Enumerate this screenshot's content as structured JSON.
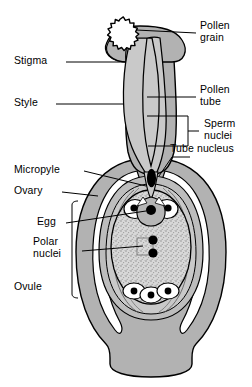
{
  "figure": {
    "type": "biological-diagram",
    "background": "#ffffff",
    "colors": {
      "tissue_gray": "#b2b2b2",
      "tissue_gray_light": "#c4c4c4",
      "embryo_sac_stipple": "#cfcfcf",
      "outline": "#000000",
      "white": "#ffffff",
      "nucleus": "#000000"
    }
  },
  "labels": {
    "left": [
      {
        "id": "stigma",
        "text": "Stigma",
        "x": 14,
        "y": 58,
        "leader_from_x": 66,
        "leader_from_y": 63,
        "leader_to_x": 118,
        "leader_to_y": 63
      },
      {
        "id": "style",
        "text": "Style",
        "x": 14,
        "y": 100,
        "leader_from_x": 56,
        "leader_from_y": 105,
        "leader_to_x": 120,
        "leader_to_y": 105
      },
      {
        "id": "micropyle",
        "text": "Micropyle",
        "x": 14,
        "y": 167,
        "leader_from_x": 80,
        "leader_from_y": 172,
        "leader_to_x": 143,
        "leader_to_y": 180
      },
      {
        "id": "ovary",
        "text": "Ovary",
        "x": 14,
        "y": 188,
        "leader_from_x": 58,
        "leader_from_y": 193,
        "leader_to_x": 99,
        "leader_to_y": 196
      },
      {
        "id": "egg",
        "text": "Egg",
        "x": 36,
        "y": 219,
        "leader_from_x": 64,
        "leader_from_y": 224,
        "leader_to_x": 141,
        "leader_to_y": 209
      },
      {
        "id": "polar-nuclei",
        "text": "Polar\nnuclei",
        "x": 36,
        "y": 240,
        "leader_from_x": 78,
        "leader_from_y": 252,
        "leader_to_x": 143,
        "leader_to_y": 247
      },
      {
        "id": "ovule",
        "text": "Ovule",
        "x": 14,
        "y": 284,
        "leader_from_x": 0,
        "leader_from_y": 0,
        "leader_to_x": 0,
        "leader_to_y": 0
      }
    ],
    "right": [
      {
        "id": "pollen-grain",
        "text": "Pollen\ngrain",
        "x": 198,
        "y": 22,
        "leader_from_x": 196,
        "leader_from_y": 33,
        "leader_to_x": 142,
        "leader_to_y": 33
      },
      {
        "id": "pollen-tube",
        "text": "Pollen\ntube",
        "x": 198,
        "y": 86,
        "leader_from_x": 196,
        "leader_from_y": 97,
        "leader_to_x": 145,
        "leader_to_y": 97
      },
      {
        "id": "sperm-nuclei",
        "text": "Sperm\nnuclei",
        "x": 203,
        "y": 120,
        "leader_from_x": 201,
        "leader_from_y": 131,
        "leader_to_x": 190,
        "leader_to_y": 131
      },
      {
        "id": "tube-nucleus",
        "text": "Tube nucleus",
        "x": 172,
        "y": 145,
        "leader_from_x": 186,
        "leader_from_y": 157,
        "leader_to_x": 157,
        "leader_to_y": 176
      }
    ]
  },
  "structures": [
    {
      "name": "pollen-grain",
      "shape": "spiky-circle",
      "cx": 120,
      "cy": 33,
      "r": 14
    },
    {
      "name": "stigma",
      "shape": "lobed-cap",
      "cx": 142,
      "cy": 55
    },
    {
      "name": "style",
      "shape": "column",
      "top_y": 62,
      "bottom_y": 175
    },
    {
      "name": "pollen-tube",
      "shape": "channel",
      "top_y": 40,
      "bottom_y": 200
    },
    {
      "name": "tube-nucleus",
      "shape": "ellipse",
      "cx": 152,
      "cy": 177,
      "rx": 4.5,
      "ry": 9
    },
    {
      "name": "sperm-nuclei",
      "shape": "ellipse-pair",
      "count": 2
    },
    {
      "name": "ovary",
      "shape": "ovoid-body"
    },
    {
      "name": "ovule",
      "shape": "nested-ovoid"
    },
    {
      "name": "embryo-sac",
      "shape": "stippled-ovoid",
      "cx": 151,
      "cy": 245
    },
    {
      "name": "egg-cell",
      "shape": "cell",
      "cx": 151,
      "cy": 210
    },
    {
      "name": "synergid-left",
      "shape": "cell",
      "cx": 136,
      "cy": 208
    },
    {
      "name": "synergid-right",
      "shape": "cell",
      "cx": 166,
      "cy": 208
    },
    {
      "name": "polar-nuclei",
      "shape": "dot-pair",
      "cx": 152,
      "cy": 246,
      "count": 2
    },
    {
      "name": "antipodal-cells",
      "shape": "cell-triplet",
      "cx": 151,
      "cy": 290,
      "count": 3
    },
    {
      "name": "receptacle",
      "shape": "flared-stalk"
    }
  ]
}
